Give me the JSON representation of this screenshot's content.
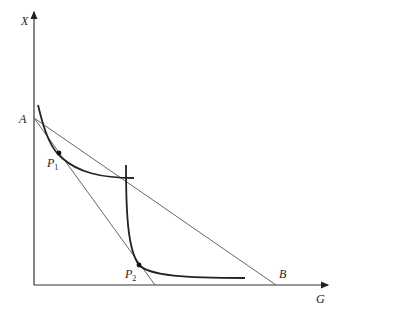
{
  "diagram": {
    "type": "economics-indifference-diagram",
    "axes": {
      "y_label": "X",
      "x_label": "G",
      "origin": [
        34,
        285
      ],
      "y_top": 12,
      "x_right": 326
    },
    "points": {
      "A": {
        "label": "A",
        "pos": [
          34,
          118
        ]
      },
      "B": {
        "label": "B",
        "pos": [
          276,
          285
        ]
      },
      "P1": {
        "label": "P",
        "sub": "1",
        "pos": [
          60,
          152
        ]
      },
      "P2": {
        "label": "P",
        "sub": "2",
        "pos": [
          139,
          265
        ]
      }
    },
    "lines": [
      {
        "name": "budget-line-AB",
        "from": [
          34,
          118
        ],
        "to": [
          276,
          285
        ]
      },
      {
        "name": "budget-line-steep",
        "from": [
          34,
          118
        ],
        "to": [
          155,
          285
        ]
      }
    ],
    "curves": [
      {
        "name": "indifference-curve-1",
        "tangent_at": "P1"
      },
      {
        "name": "indifference-curve-2",
        "tangent_at": "P2"
      }
    ],
    "colors": {
      "line": "#333333",
      "curve": "#222222",
      "text": "#222222"
    }
  }
}
